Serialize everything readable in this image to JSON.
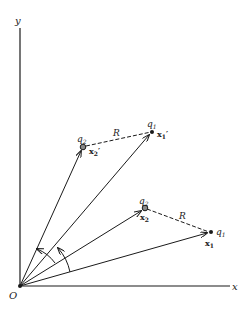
{
  "diagram": {
    "axes": {
      "x_label": "x",
      "y_label": "y",
      "origin_label": "O"
    },
    "initial_config": {
      "q2": {
        "charge_label": "q",
        "charge_sub": "2",
        "pos_label": "x",
        "pos_sub": "2"
      },
      "q1": {
        "charge_label": "q",
        "charge_sub": "1",
        "pos_label": "x",
        "pos_sub": "1"
      },
      "separation_label": "R"
    },
    "rotated_config": {
      "q2": {
        "charge_label": "q",
        "charge_sub": "2",
        "pos_label": "x",
        "pos_sub": "2",
        "prime": "′"
      },
      "q1": {
        "charge_label": "q",
        "charge_sub": "1",
        "pos_label": "x",
        "pos_sub": "1",
        "prime": "′"
      },
      "separation_label": "R"
    },
    "colors": {
      "ink": "#1a1a1a",
      "background": "#ffffff"
    }
  }
}
